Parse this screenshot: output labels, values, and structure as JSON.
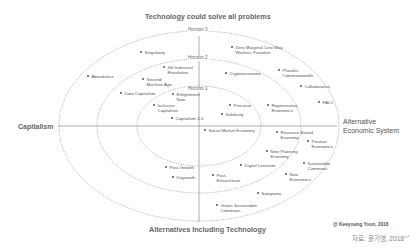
{
  "diagram": {
    "title_top": "Technology could solve all problems",
    "title_bottom": "Alternatives Including Technology",
    "axis_left": "Capitalism",
    "axis_right_line1": "Alternative",
    "axis_right_line2": "Economic System",
    "horizons": [
      {
        "label": "Horizon 3"
      },
      {
        "label": "Horizon 2"
      },
      {
        "label": "Horizon 1"
      }
    ],
    "items": [
      {
        "l1": "Singularity",
        "l2": ""
      },
      {
        "l1": "Zero Marginal Cost Way",
        "l2": "Workers Paradise"
      },
      {
        "l1": "Abundance",
        "l2": ""
      },
      {
        "l1": "4th Industrial",
        "l2": "Revolution"
      },
      {
        "l1": "Second",
        "l2": "Machine Age"
      },
      {
        "l1": "Data Capitalism",
        "l2": ""
      },
      {
        "l1": "Cryptoeconomic",
        "l2": ""
      },
      {
        "l1": "Pluralist",
        "l2": "Commonwealth"
      },
      {
        "l1": "Collaborative",
        "l2": ""
      },
      {
        "l1": "FALC",
        "l2": ""
      },
      {
        "l1": "Enlightment",
        "l2": "Now"
      },
      {
        "l1": "Inclusive",
        "l2": "Capitalism"
      },
      {
        "l1": "Capitalism 4.0",
        "l2": ""
      },
      {
        "l1": "Precariat",
        "l2": ""
      },
      {
        "l1": "Solidarity",
        "l2": ""
      },
      {
        "l1": "Regenerative",
        "l2": "Economics"
      },
      {
        "l1": "Social Market Economy",
        "l2": ""
      },
      {
        "l1": "Resource Based",
        "l2": "Economy"
      },
      {
        "l1": "Positive",
        "l2": "Economics"
      },
      {
        "l1": "New Planning",
        "l2": "Economy"
      },
      {
        "l1": "Digital Leninism",
        "l2": ""
      },
      {
        "l1": "Sustainable",
        "l2": "Commons"
      },
      {
        "l1": "Post-Growth",
        "l2": ""
      },
      {
        "l1": "Degrowth",
        "l2": ""
      },
      {
        "l1": "Post-",
        "l2": "Extractivism"
      },
      {
        "l1": "New",
        "l2": "Economics"
      },
      {
        "l1": "Satoyama",
        "l2": ""
      },
      {
        "l1": "Green Sustainable",
        "l2": "Commons"
      }
    ],
    "credit": "@ Keeyoung Yoon, 2018",
    "source": "자료: 윤기영, 2018",
    "source_sup": "SoF",
    "colors": {
      "line": "#999999",
      "dotted": "#888888",
      "text": "#555555"
    }
  }
}
